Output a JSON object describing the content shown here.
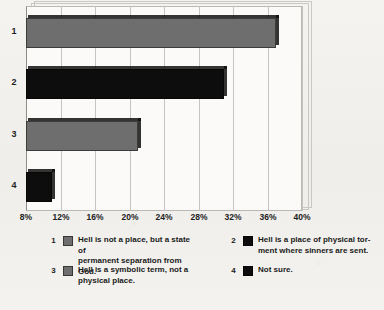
{
  "chart_data": {
    "type": "bar",
    "orientation": "horizontal",
    "title": "",
    "subtitle": "",
    "xlabel": "",
    "ylabel": "",
    "xlim": [
      8,
      40
    ],
    "grid": true,
    "legend_position": "bottom",
    "categories": [
      "1",
      "2",
      "3",
      "4"
    ],
    "values": [
      37,
      31,
      21,
      11
    ],
    "tick_labels": [
      "8%",
      "12%",
      "16%",
      "20%",
      "24%",
      "28%",
      "32%",
      "36%",
      "40%"
    ],
    "tick_values": [
      8,
      12,
      16,
      20,
      24,
      28,
      32,
      36,
      40
    ],
    "series": [
      {
        "name": "Hell is not a place, but a state of permanent separation from God.",
        "key": "1",
        "value": 37,
        "color": "#6e6e6e"
      },
      {
        "name": "Hell is a place of physical torment where sinners are sent.",
        "key": "2",
        "value": 31,
        "color": "#0d0d0d"
      },
      {
        "name": "Hell is a symbolic term, not a physical place.",
        "key": "3",
        "value": 21,
        "color": "#6e6e6e"
      },
      {
        "name": "Not sure.",
        "key": "4",
        "value": 11,
        "color": "#0d0d0d"
      }
    ]
  },
  "axis": {
    "ticks": [
      {
        "label": "8%"
      },
      {
        "label": "12%"
      },
      {
        "label": "16%"
      },
      {
        "label": "20%"
      },
      {
        "label": "24%"
      },
      {
        "label": "28%"
      },
      {
        "label": "32%"
      },
      {
        "label": "36%"
      },
      {
        "label": "40%"
      }
    ],
    "categories": [
      {
        "label": "1"
      },
      {
        "label": "2"
      },
      {
        "label": "3"
      },
      {
        "label": "4"
      }
    ]
  },
  "legend": {
    "items": [
      {
        "number": "1",
        "line1": "Hell is not a place, but a state of",
        "line2": "permanent separation from God.",
        "color": "#6e6e6e"
      },
      {
        "number": "2",
        "line1": "Hell is a place of physical tor-",
        "line2": "ment where sinners are sent.",
        "color": "#0d0d0d"
      },
      {
        "number": "3",
        "line1": "Hell is a symbolic term, not a",
        "line2": "physical place.",
        "color": "#6e6e6e"
      },
      {
        "number": "4",
        "line1": "Not sure.",
        "line2": "",
        "color": "#0d0d0d"
      }
    ]
  }
}
